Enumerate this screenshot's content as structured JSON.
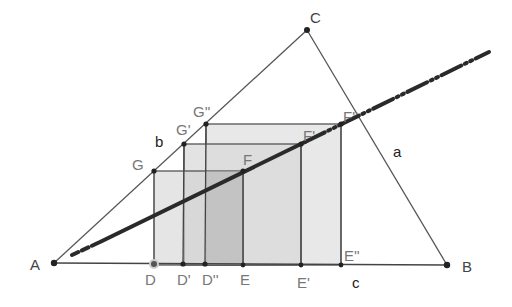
{
  "diagram": {
    "colors": {
      "background": "#ffffff",
      "triangle_stroke": "#555555",
      "square_stroke": "#555555",
      "square_fill_light": "#e6e6e6",
      "square_fill_mid": "#d2d2d2",
      "square_fill_dark": "#b8b8b8",
      "locus_line": "#2a2a2a",
      "point_fill": "#222222",
      "label_color": "#444444"
    },
    "vertices": {
      "A": {
        "label": "A",
        "x": 54,
        "y": 263
      },
      "B": {
        "label": "B",
        "x": 447,
        "y": 265
      },
      "C": {
        "label": "C",
        "x": 307,
        "y": 30
      }
    },
    "sides": {
      "a": {
        "label": "a",
        "x": 394,
        "y": 157
      },
      "b": {
        "label": "b",
        "x": 155,
        "y": 146
      },
      "c": {
        "label": "c",
        "x": 352,
        "y": 288
      }
    },
    "squares": [
      {
        "name": "square-DEFG",
        "fill": "#e4e4e4",
        "points": {
          "D": {
            "label": "D",
            "x": 154,
            "y": 264
          },
          "E": {
            "label": "E",
            "x": 243,
            "y": 265
          },
          "F": {
            "label": "F",
            "x": 243,
            "y": 171
          },
          "G": {
            "label": "G",
            "x": 154,
            "y": 171
          }
        }
      },
      {
        "name": "square-D1E1F1G1",
        "fill": "#d6d6d6",
        "points": {
          "D": {
            "label": "D'",
            "x": 183,
            "y": 264
          },
          "E": {
            "label": "E'",
            "x": 301,
            "y": 265
          },
          "F": {
            "label": "F'",
            "x": 301,
            "y": 144
          },
          "G": {
            "label": "G'",
            "x": 184,
            "y": 144
          }
        }
      },
      {
        "name": "square-D2E2F2G2",
        "fill": "#e6e6e6",
        "points": {
          "D": {
            "label": "D''",
            "x": 205,
            "y": 264
          },
          "E": {
            "label": "E''",
            "x": 341,
            "y": 265
          },
          "F": {
            "label": "F''",
            "x": 341,
            "y": 124
          },
          "G": {
            "label": "G''",
            "x": 206,
            "y": 124
          }
        }
      }
    ],
    "locus_line": {
      "label": "locus of F",
      "style": "thick, dashed near ends",
      "start": {
        "x": 72,
        "y": 255
      },
      "solid_from": {
        "x": 100,
        "y": 242
      },
      "solid_to": {
        "x": 305,
        "y": 142
      },
      "end": {
        "x": 489,
        "y": 52
      }
    },
    "label_positions": {
      "A": {
        "x": 30,
        "y": 270
      },
      "B": {
        "x": 462,
        "y": 272
      },
      "C": {
        "x": 310,
        "y": 22
      },
      "G": {
        "x": 132,
        "y": 170
      },
      "G1": {
        "x": 176,
        "y": 135
      },
      "G2": {
        "x": 194,
        "y": 116
      },
      "F": {
        "x": 243,
        "y": 163
      },
      "F1": {
        "x": 303,
        "y": 141
      },
      "F2": {
        "x": 344,
        "y": 121
      },
      "D": {
        "x": 144,
        "y": 285
      },
      "D1": {
        "x": 177,
        "y": 285
      },
      "D2": {
        "x": 202,
        "y": 285
      },
      "E": {
        "x": 240,
        "y": 285
      },
      "E1": {
        "x": 297,
        "y": 288
      },
      "E2": {
        "x": 344,
        "y": 261
      }
    }
  }
}
